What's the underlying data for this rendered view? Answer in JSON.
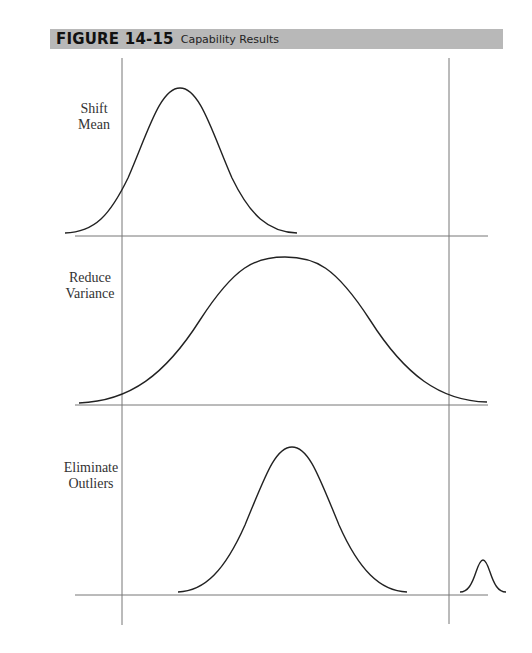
{
  "figure": {
    "number": "FIGURE 14-15",
    "title": "Capability Results"
  },
  "panels": [
    {
      "label_line1": "Shift",
      "label_line2": "Mean"
    },
    {
      "label_line1": "Reduce",
      "label_line2": "Variance"
    },
    {
      "label_line1": "Eliminate",
      "label_line2": "Outliers"
    }
  ],
  "diagram": {
    "spec_limits": [
      "lower",
      "upper"
    ],
    "colors": {
      "header_bg": "#b8b8b8",
      "line": "#222222",
      "axis": "#777777"
    }
  }
}
